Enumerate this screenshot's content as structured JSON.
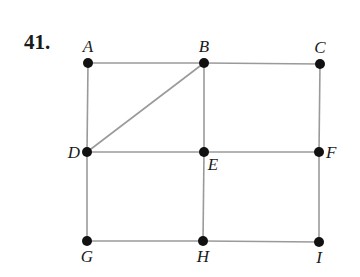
{
  "problem_number": "41.",
  "colors": {
    "edge": "#9a9a9a",
    "node": "#111111",
    "label": "#1a1a1a"
  },
  "nodes": [
    {
      "id": "A",
      "label": "A",
      "x": 88,
      "y": 63,
      "lx": 88,
      "ly": 52,
      "anchor": "middle"
    },
    {
      "id": "B",
      "label": "B",
      "x": 204,
      "y": 63,
      "lx": 204,
      "ly": 52,
      "anchor": "middle"
    },
    {
      "id": "C",
      "label": "C",
      "x": 320,
      "y": 64,
      "lx": 320,
      "ly": 53,
      "anchor": "middle"
    },
    {
      "id": "D",
      "label": "D",
      "x": 87,
      "y": 152,
      "lx": 80,
      "ly": 158,
      "anchor": "end"
    },
    {
      "id": "E",
      "label": "E",
      "x": 204,
      "y": 152,
      "lx": 213,
      "ly": 170,
      "anchor": "middle"
    },
    {
      "id": "F",
      "label": "F",
      "x": 319,
      "y": 152,
      "lx": 326,
      "ly": 158,
      "anchor": "start"
    },
    {
      "id": "G",
      "label": "G",
      "x": 87,
      "y": 241,
      "lx": 87,
      "ly": 262,
      "anchor": "middle"
    },
    {
      "id": "H",
      "label": "H",
      "x": 203,
      "y": 241,
      "lx": 203,
      "ly": 262,
      "anchor": "middle"
    },
    {
      "id": "I",
      "label": "I",
      "x": 319,
      "y": 242,
      "lx": 319,
      "ly": 263,
      "anchor": "middle"
    }
  ],
  "edges": [
    [
      "A",
      "B"
    ],
    [
      "B",
      "C"
    ],
    [
      "A",
      "D"
    ],
    [
      "B",
      "D"
    ],
    [
      "B",
      "E"
    ],
    [
      "C",
      "F"
    ],
    [
      "D",
      "E"
    ],
    [
      "E",
      "F"
    ],
    [
      "D",
      "G"
    ],
    [
      "E",
      "H"
    ],
    [
      "F",
      "I"
    ],
    [
      "G",
      "H"
    ],
    [
      "H",
      "I"
    ]
  ]
}
